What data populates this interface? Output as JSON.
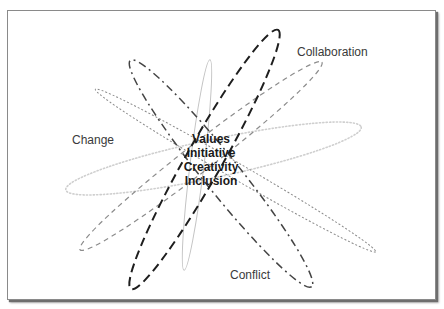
{
  "diagram": {
    "title": "",
    "outer_labels": {
      "collaboration": "Collaboration",
      "change": "Change",
      "conflict": "Conflict"
    },
    "core_terms": [
      "Values",
      "Initiative",
      "Creativity",
      "Inclusion"
    ],
    "orbits": [
      {
        "name": "bold-long-dash-orbit",
        "style": "long-dash",
        "color": "#1e1e1e"
      },
      {
        "name": "dash-dot-orbit",
        "style": "dash-dot",
        "color": "#444444"
      },
      {
        "name": "thin-solid-orbit",
        "style": "solid",
        "color": "#c4c4c4"
      },
      {
        "name": "dashed-orbit",
        "style": "dashed",
        "color": "#8c8c8c"
      },
      {
        "name": "dotted-orbit",
        "style": "dotted",
        "color": "#cfcfcf"
      },
      {
        "name": "fine-dotted-orbit",
        "style": "fine-dash",
        "color": "#8a8a8a"
      }
    ]
  }
}
